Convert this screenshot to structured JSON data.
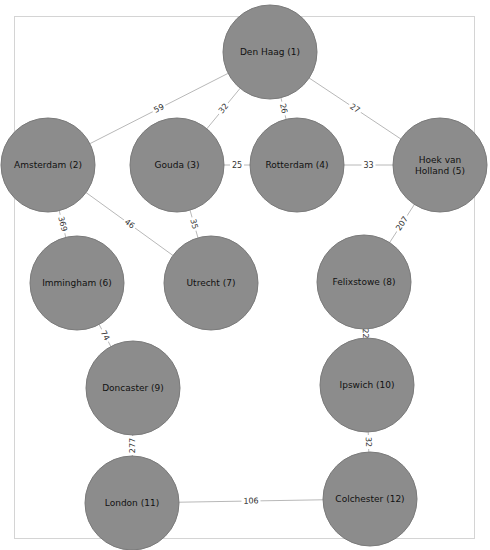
{
  "graph": {
    "title": "",
    "node_color": "#8c8c8c",
    "edge_color": "#b8b8b8",
    "node_radius": 47,
    "nodes": [
      {
        "id": 1,
        "label": "Den Haag (1)",
        "lines": [
          "Den Haag (1)"
        ],
        "x": 270,
        "y": 52
      },
      {
        "id": 2,
        "label": "Amsterdam (2)",
        "lines": [
          "Amsterdam (2)"
        ],
        "x": 48,
        "y": 165
      },
      {
        "id": 3,
        "label": "Gouda (3)",
        "lines": [
          "Gouda (3)"
        ],
        "x": 177,
        "y": 165
      },
      {
        "id": 4,
        "label": "Rotterdam (4)",
        "lines": [
          "Rotterdam (4)"
        ],
        "x": 297,
        "y": 165
      },
      {
        "id": 5,
        "label": "Hoek van Holland (5)",
        "lines": [
          "Hoek van",
          "Holland (5)"
        ],
        "x": 440,
        "y": 165
      },
      {
        "id": 6,
        "label": "Immingham (6)",
        "lines": [
          "Immingham (6)"
        ],
        "x": 77,
        "y": 283
      },
      {
        "id": 7,
        "label": "Utrecht (7)",
        "lines": [
          "Utrecht (7)"
        ],
        "x": 211,
        "y": 283
      },
      {
        "id": 8,
        "label": "Felixstowe (8)",
        "lines": [
          "Felixstowe (8)"
        ],
        "x": 364,
        "y": 282
      },
      {
        "id": 9,
        "label": "Doncaster (9)",
        "lines": [
          "Doncaster (9)"
        ],
        "x": 133,
        "y": 388
      },
      {
        "id": 10,
        "label": "Ipswich (10)",
        "lines": [
          "Ipswich (10)"
        ],
        "x": 367,
        "y": 385
      },
      {
        "id": 11,
        "label": "London (11)",
        "lines": [
          "London (11)"
        ],
        "x": 132,
        "y": 503
      },
      {
        "id": 12,
        "label": "Colchester (12)",
        "lines": [
          "Colchester (12)"
        ],
        "x": 370,
        "y": 499
      }
    ],
    "edges": [
      {
        "from": 1,
        "to": 2,
        "weight": "59"
      },
      {
        "from": 1,
        "to": 3,
        "weight": "32"
      },
      {
        "from": 1,
        "to": 4,
        "weight": "26"
      },
      {
        "from": 1,
        "to": 5,
        "weight": "27"
      },
      {
        "from": 3,
        "to": 4,
        "weight": "25"
      },
      {
        "from": 4,
        "to": 5,
        "weight": "33"
      },
      {
        "from": 2,
        "to": 6,
        "weight": "369"
      },
      {
        "from": 2,
        "to": 7,
        "weight": "46"
      },
      {
        "from": 3,
        "to": 7,
        "weight": "35"
      },
      {
        "from": 5,
        "to": 8,
        "weight": "207"
      },
      {
        "from": 6,
        "to": 9,
        "weight": "74"
      },
      {
        "from": 8,
        "to": 10,
        "weight": "22"
      },
      {
        "from": 9,
        "to": 11,
        "weight": "277"
      },
      {
        "from": 10,
        "to": 12,
        "weight": "32"
      },
      {
        "from": 11,
        "to": 12,
        "weight": "106"
      }
    ]
  }
}
